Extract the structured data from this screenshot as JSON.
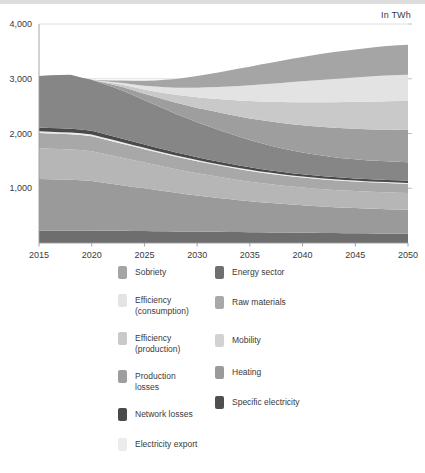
{
  "figure": {
    "unit_label": "In TWh"
  },
  "chart_data": {
    "type": "area",
    "stacked": true,
    "title": "",
    "subtitle": "",
    "xlabel": "",
    "ylabel": "",
    "unit": "In TWh",
    "grid": true,
    "legend_position": "bottom",
    "xlim": [
      2015,
      2050
    ],
    "ylim": [
      0,
      4000
    ],
    "yticks": [
      1000,
      2000,
      3000,
      4000
    ],
    "ytick_labels": [
      "1,000",
      "2,000",
      "3,000",
      "4,000"
    ],
    "xticks": [
      2015,
      2020,
      2025,
      2030,
      2035,
      2040,
      2045,
      2050
    ],
    "xtick_labels": [
      "2015",
      "2020",
      "2025",
      "2030",
      "2035",
      "2040",
      "2045",
      "2050"
    ],
    "x": [
      2015,
      2016,
      2017,
      2018,
      2019,
      2020,
      2021,
      2022,
      2023,
      2024,
      2025,
      2026,
      2027,
      2028,
      2029,
      2030,
      2031,
      2032,
      2033,
      2034,
      2035,
      2036,
      2037,
      2038,
      2039,
      2040,
      2041,
      2042,
      2043,
      2044,
      2045,
      2046,
      2047,
      2048,
      2049,
      2050
    ],
    "series": [
      {
        "name": "Specific electricity",
        "color": "#6e6e6e",
        "values": [
          230,
          230,
          230,
          230,
          230,
          228,
          226,
          224,
          222,
          220,
          218,
          216,
          214,
          212,
          210,
          208,
          206,
          204,
          202,
          200,
          198,
          196,
          194,
          192,
          190,
          188,
          186,
          184,
          182,
          180,
          178,
          176,
          174,
          172,
          170,
          168
        ]
      },
      {
        "name": "Heating",
        "color": "#9a9a9a",
        "values": [
          940,
          935,
          930,
          925,
          918,
          905,
          880,
          855,
          830,
          805,
          780,
          755,
          730,
          705,
          682,
          660,
          640,
          620,
          600,
          582,
          565,
          550,
          536,
          523,
          511,
          500,
          490,
          481,
          473,
          466,
          460,
          455,
          450,
          446,
          442,
          438
        ]
      },
      {
        "name": "Mobility",
        "color": "#b6b6b6",
        "values": [
          560,
          558,
          556,
          554,
          550,
          545,
          530,
          515,
          500,
          486,
          472,
          458,
          445,
          432,
          420,
          408,
          397,
          386,
          376,
          366,
          357,
          349,
          342,
          336,
          330,
          325,
          321,
          318,
          315,
          313,
          311,
          309,
          308,
          307,
          306,
          305
        ]
      },
      {
        "name": "Raw materials",
        "color": "#a8a8a8",
        "values": [
          280,
          279,
          278,
          277,
          276,
          274,
          268,
          262,
          256,
          250,
          244,
          238,
          232,
          227,
          222,
          217,
          212,
          208,
          204,
          200,
          196,
          193,
          190,
          187,
          184,
          182,
          180,
          178,
          176,
          175,
          174,
          173,
          172,
          171,
          170,
          169
        ]
      },
      {
        "name": "Electricity export",
        "color": "#ececec",
        "values": [
          30,
          30,
          30,
          30,
          30,
          30,
          29,
          28,
          27,
          26,
          25,
          24,
          24,
          23,
          23,
          22,
          22,
          21,
          21,
          20,
          20,
          20,
          19,
          19,
          19,
          18,
          18,
          18,
          18,
          17,
          17,
          17,
          17,
          17,
          17,
          17
        ]
      },
      {
        "name": "Network losses",
        "color": "#4a4a4a",
        "values": [
          70,
          70,
          70,
          70,
          70,
          69,
          67,
          65,
          63,
          61,
          59,
          57,
          56,
          54,
          53,
          51,
          50,
          49,
          48,
          47,
          46,
          45,
          44,
          43,
          42,
          42,
          41,
          41,
          40,
          40,
          40,
          39,
          39,
          39,
          39,
          39
        ]
      },
      {
        "name": "Energy sector",
        "color": "#868686",
        "values": [
          940,
          960,
          975,
          985,
          950,
          930,
          915,
          900,
          880,
          845,
          810,
          775,
          740,
          705,
          672,
          640,
          610,
          580,
          552,
          524,
          498,
          474,
          452,
          432,
          414,
          398,
          384,
          372,
          362,
          354,
          348,
          344,
          342,
          341,
          341,
          340
        ]
      },
      {
        "name": "Production losses",
        "color": "#9e9e9e",
        "values": [
          0,
          0,
          0,
          0,
          0,
          0,
          20,
          42,
          66,
          92,
          118,
          146,
          174,
          203,
          232,
          262,
          290,
          318,
          345,
          371,
          396,
          419,
          441,
          461,
          480,
          497,
          512,
          526,
          538,
          549,
          558,
          566,
          573,
          579,
          584,
          588
        ]
      },
      {
        "name": "Efficiency (production)",
        "color": "#c9c9c9",
        "values": [
          0,
          0,
          0,
          0,
          0,
          0,
          12,
          26,
          42,
          60,
          79,
          100,
          122,
          145,
          169,
          194,
          219,
          244,
          269,
          293,
          317,
          340,
          362,
          383,
          403,
          421,
          438,
          454,
          468,
          481,
          492,
          502,
          511,
          518,
          524,
          529
        ]
      },
      {
        "name": "Efficiency (consumption)",
        "color": "#e3e3e3",
        "values": [
          0,
          0,
          0,
          0,
          0,
          0,
          10,
          22,
          36,
          52,
          69,
          88,
          108,
          129,
          151,
          174,
          197,
          220,
          243,
          266,
          288,
          309,
          329,
          348,
          366,
          383,
          398,
          412,
          425,
          436,
          446,
          455,
          463,
          470,
          476,
          481
        ]
      },
      {
        "name": "Sobriety",
        "color": "#a5a5a5",
        "values": [
          0,
          0,
          0,
          0,
          0,
          0,
          14,
          30,
          48,
          68,
          90,
          113,
          137,
          162,
          188,
          214,
          240,
          266,
          291,
          316,
          340,
          363,
          385,
          406,
          426,
          444,
          461,
          476,
          490,
          502,
          512,
          521,
          529,
          536,
          542,
          547
        ]
      }
    ]
  },
  "legend": {
    "left_column": [
      {
        "label": "Sobriety",
        "color": "#a5a5a5"
      },
      {
        "label": "Efficiency\n(consumption)",
        "color": "#e3e3e3"
      },
      {
        "label": "Efficiency\n(production)",
        "color": "#c9c9c9"
      },
      {
        "label": "Production\nlosses",
        "color": "#9e9e9e"
      },
      {
        "label": "Network losses",
        "color": "#4a4a4a"
      },
      {
        "label": "Electricity export",
        "color": "#ececec"
      }
    ],
    "right_column": [
      {
        "label": "Energy sector",
        "color": "#6f6f6f"
      },
      {
        "label": "Raw materials",
        "color": "#a8a8a8"
      },
      {
        "label": "Mobility",
        "color": "#d2d2d2"
      },
      {
        "label": "Heating",
        "color": "#9a9a9a"
      },
      {
        "label": "Specific electricity",
        "color": "#4f4f4f"
      }
    ]
  }
}
